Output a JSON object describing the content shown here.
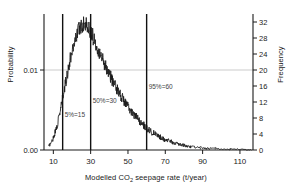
{
  "chart_data": {
    "type": "line",
    "title": "",
    "subtitle": "",
    "xlabel_prefix": "Modelled CO",
    "xlabel_sub": "2",
    "xlabel_suffix": " seepage rate (t/year)",
    "xlabel": "Modelled CO2 seepage rate (t/year)",
    "ylabel_left": "Probability",
    "ylabel_right": "Frequency",
    "xlim": [
      5,
      117
    ],
    "xticks": [
      10,
      30,
      50,
      70,
      90,
      110
    ],
    "xticklabels": [
      "10",
      "30",
      "50",
      "70",
      "90",
      "110"
    ],
    "ylim_left": [
      0.0,
      0.0165
    ],
    "yticks_left": [
      0.0,
      0.01
    ],
    "yticklabels_left": [
      "0.00",
      "0.01"
    ],
    "ylim_right": [
      0,
      33
    ],
    "yticks_right": [
      0,
      4,
      8,
      12,
      16,
      20,
      24,
      28,
      32
    ],
    "yticklabels_right": [
      "0",
      "4",
      "8",
      "12",
      "16",
      "20",
      "24",
      "28",
      "32"
    ],
    "gridlines_horizontal": [
      0.01
    ],
    "grid": "single horizontal gridline at 0.01 / frequency 20",
    "legend": "none",
    "series_color": "#1a1a1a",
    "annotation_color": "#444444",
    "percentile_lines": [
      {
        "label": "5%=15",
        "x": 15,
        "percentile": 5,
        "value": 15
      },
      {
        "label": "50%=30",
        "x": 30,
        "percentile": 50,
        "value": 30
      },
      {
        "label": "95%=60",
        "x": 60,
        "percentile": 95,
        "value": 60
      }
    ],
    "x": [
      7.5,
      8.2,
      9.0,
      9.8,
      10.5,
      11.2,
      12.0,
      12.8,
      13.5,
      14.2,
      15.0,
      15.8,
      16.5,
      17.2,
      18.0,
      18.8,
      19.5,
      20.2,
      21.0,
      21.8,
      22.5,
      23.2,
      24.0,
      24.8,
      25.5,
      26.2,
      27.0,
      27.8,
      28.5,
      29.2,
      30.0,
      30.8,
      31.5,
      32.2,
      33.0,
      33.8,
      34.5,
      35.2,
      36.0,
      36.8,
      37.5,
      38.2,
      39.0,
      39.8,
      40.5,
      41.2,
      42.0,
      42.8,
      43.5,
      44.2,
      45.0,
      45.8,
      46.5,
      47.2,
      48.0,
      48.8,
      49.5,
      50.2,
      51.0,
      51.8,
      52.5,
      53.2,
      54.0,
      54.8,
      55.5,
      56.2,
      57.0,
      57.8,
      58.5,
      59.2,
      60.0,
      60.8,
      61.5,
      62.2,
      63.0,
      63.8,
      64.5,
      65.2,
      66.0,
      66.8,
      67.5,
      68.2,
      69.0,
      69.8,
      70.5,
      71.2,
      72.0,
      72.8,
      73.5,
      74.2,
      75.0,
      76.0,
      77.0,
      78.0,
      79.0,
      80.0,
      81.0,
      82.0,
      83.0,
      84.0,
      85.0,
      86.5,
      88.0,
      89.5,
      91.0,
      93.0,
      95.0,
      97.0,
      99.0,
      101.0,
      103.0,
      105.0,
      108.0,
      111.0,
      114.0,
      116.0
    ],
    "values_probability": [
      0.0005,
      0.0007,
      0.001,
      0.0014,
      0.0019,
      0.0024,
      0.0031,
      0.0038,
      0.0046,
      0.0055,
      0.0064,
      0.0073,
      0.0083,
      0.0092,
      0.0101,
      0.011,
      0.0118,
      0.0126,
      0.0133,
      0.0139,
      0.0145,
      0.0149,
      0.0153,
      0.0155,
      0.0157,
      0.0158,
      0.0157,
      0.0156,
      0.0154,
      0.0151,
      0.0148,
      0.0144,
      0.014,
      0.0136,
      0.0132,
      0.0128,
      0.0124,
      0.012,
      0.0116,
      0.0112,
      0.0108,
      0.0104,
      0.01,
      0.0096,
      0.0093,
      0.0089,
      0.0086,
      0.0082,
      0.0079,
      0.0076,
      0.0073,
      0.007,
      0.0067,
      0.0064,
      0.0061,
      0.0058,
      0.0056,
      0.0053,
      0.0051,
      0.0048,
      0.0046,
      0.0044,
      0.0042,
      0.004,
      0.0038,
      0.0036,
      0.0034,
      0.0032,
      0.0031,
      0.0029,
      0.0028,
      0.0026,
      0.0025,
      0.0023,
      0.0022,
      0.0021,
      0.002,
      0.0019,
      0.0018,
      0.0017,
      0.0016,
      0.0015,
      0.0014,
      0.0013,
      0.0013,
      0.0012,
      0.0011,
      0.0011,
      0.001,
      0.0009,
      0.0009,
      0.0008,
      0.0007,
      0.0007,
      0.0006,
      0.0006,
      0.0005,
      0.0005,
      0.0004,
      0.0004,
      0.0004,
      0.0003,
      0.0003,
      0.0003,
      0.0002,
      0.0002,
      0.0002,
      0.0002,
      0.0001,
      0.0001,
      0.0001,
      0.0001,
      0.0001,
      0.0001,
      0.0,
      0.0
    ],
    "values_frequency": [
      1,
      1.4,
      2,
      2.8,
      3.8,
      4.8,
      6.2,
      7.6,
      9.2,
      11,
      12.8,
      14.6,
      16.6,
      18.4,
      20.2,
      22,
      23.6,
      25.2,
      26.6,
      27.8,
      29,
      29.8,
      30.6,
      31,
      31.4,
      31.6,
      31.4,
      31.2,
      30.8,
      30.2,
      29.6,
      28.8,
      28,
      27.2,
      26.4,
      25.6,
      24.8,
      24,
      23.2,
      22.4,
      21.6,
      20.8,
      20,
      19.2,
      18.6,
      17.8,
      17.2,
      16.4,
      15.8,
      15.2,
      14.6,
      14,
      13.4,
      12.8,
      12.2,
      11.6,
      11.2,
      10.6,
      10.2,
      9.6,
      9.2,
      8.8,
      8.4,
      8,
      7.6,
      7.2,
      6.8,
      6.4,
      6.2,
      5.8,
      5.6,
      5.2,
      5,
      4.6,
      4.4,
      4.2,
      4,
      3.8,
      3.6,
      3.4,
      3.2,
      3,
      2.8,
      2.6,
      2.6,
      2.4,
      2.2,
      2.2,
      2,
      1.8,
      1.8,
      1.6,
      1.4,
      1.4,
      1.2,
      1.2,
      1,
      1,
      0.8,
      0.8,
      0.8,
      0.6,
      0.6,
      0.6,
      0.4,
      0.4,
      0.4,
      0.4,
      0.2,
      0.2,
      0.2,
      0.2,
      0.2,
      0.2,
      0,
      0
    ],
    "noise_description": "empirical histogram trace with high-frequency jitter superimposed on the smooth skewed distribution"
  }
}
